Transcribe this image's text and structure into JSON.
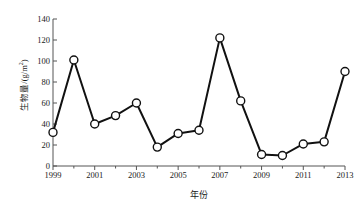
{
  "chart_data": {
    "type": "line",
    "title": "",
    "subtitle": "",
    "xlabel": "年份",
    "ylabel": "生物量/(g/m2)",
    "ylabel_base": "生物量/(g/m",
    "ylabel_sup": "2",
    "ylabel_close": ")",
    "x": [
      1999,
      2000,
      2001,
      2002,
      2003,
      2004,
      2005,
      2006,
      2007,
      2008,
      2009,
      2010,
      2011,
      2012,
      2013
    ],
    "values": [
      32,
      101,
      40,
      48,
      60,
      18,
      31,
      34,
      122,
      62,
      11,
      10,
      21,
      23,
      90
    ],
    "series": [
      {
        "name": "生物量",
        "values": [
          32,
          101,
          40,
          48,
          60,
          18,
          31,
          34,
          122,
          62,
          11,
          10,
          21,
          23,
          90
        ]
      }
    ],
    "xlim": [
      1999,
      2013
    ],
    "ylim": [
      0,
      140
    ],
    "ytick_values": [
      0,
      20,
      40,
      60,
      80,
      100,
      120,
      140
    ],
    "ytick_labels": [
      "0",
      "20",
      "40",
      "60",
      "80",
      "100",
      "120",
      "140"
    ],
    "xtick_values": [
      1999,
      2001,
      2003,
      2005,
      2007,
      2009,
      2011,
      2013
    ],
    "xtick_labels": [
      "1999",
      "2001",
      "2003",
      "2005",
      "2007",
      "2009",
      "2011",
      "2013"
    ],
    "xminor_values": [
      2000,
      2002,
      2004,
      2006,
      2008,
      2010,
      2012
    ],
    "grid": false,
    "legend": false,
    "legend_position": "none",
    "marker": "open-circle",
    "line_color": "#111111",
    "marker_fill": "#ffffff",
    "marker_edge": "#111111",
    "axis_color": "#555555",
    "line_width": 2.0,
    "marker_size": 4.0
  }
}
